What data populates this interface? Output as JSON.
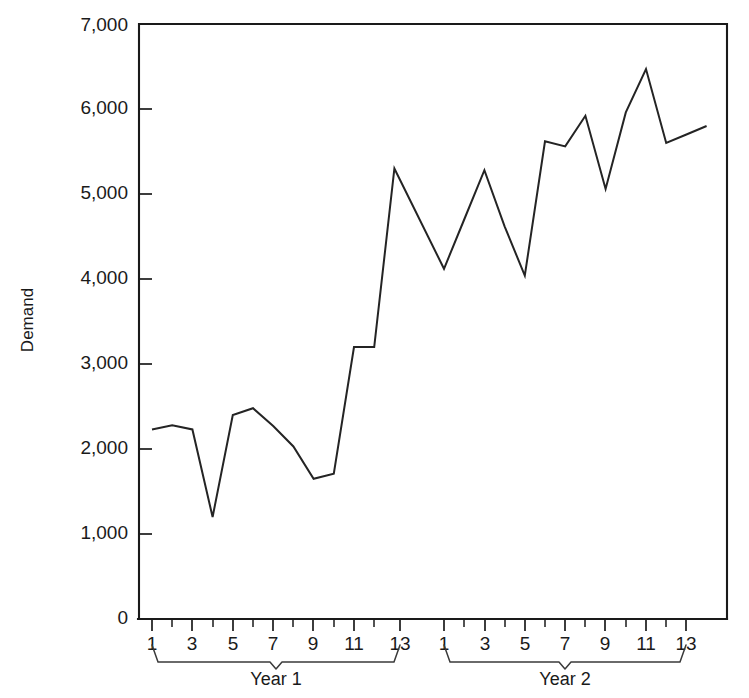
{
  "chart_data": {
    "type": "line",
    "title": "",
    "xlabel": "",
    "ylabel": "Demand",
    "ylim": [
      0,
      7000
    ],
    "grid": false,
    "legend": "none",
    "y_ticks": [
      0,
      1000,
      2000,
      3000,
      4000,
      5000,
      6000,
      7000
    ],
    "y_tick_labels": [
      "0",
      "1,000",
      "2,000",
      "3,000",
      "4,000",
      "5,000",
      "6,000",
      "7,000"
    ],
    "x_tick_labels": [
      "1",
      "3",
      "5",
      "7",
      "9",
      "11",
      "13"
    ],
    "x_minor_ticks_between": true,
    "groups": [
      {
        "label": "Year 1",
        "periods": [
          1,
          2,
          3,
          4,
          5,
          6,
          7,
          8,
          9,
          10,
          11,
          12,
          13
        ]
      },
      {
        "label": "Year 2",
        "periods": [
          1,
          2,
          3,
          4,
          5,
          6,
          7,
          8,
          9,
          10,
          11,
          12,
          13
        ]
      }
    ],
    "series": [
      {
        "name": "Demand",
        "color": "#242424",
        "x": [
          1,
          2,
          3,
          4,
          5,
          6,
          7,
          8,
          9,
          10,
          11,
          12,
          13,
          14,
          15,
          16,
          17,
          18,
          19,
          20,
          21,
          22,
          23,
          24,
          25,
          26,
          27
        ],
        "values": [
          2230,
          2280,
          2230,
          1200,
          2400,
          2480,
          2270,
          2030,
          1650,
          1710,
          3200,
          3200,
          5300,
          4120,
          4700,
          5280,
          4620,
          4040,
          5620,
          5560,
          5920,
          5060,
          5960,
          6470,
          5600,
          5700,
          5800
        ]
      }
    ]
  },
  "axes": {
    "y_axis_title": "Demand"
  }
}
